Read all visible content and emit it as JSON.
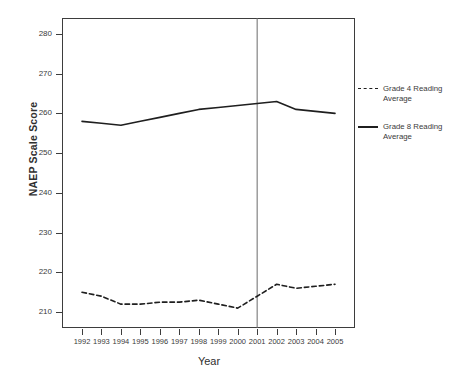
{
  "chart_data": {
    "type": "line",
    "title": "",
    "xlabel": "Year",
    "ylabel": "NAEP Scale Score",
    "categories": [
      1992,
      1993,
      1994,
      1995,
      1996,
      1997,
      1998,
      1999,
      2000,
      2001,
      2002,
      2003,
      2004,
      2005
    ],
    "x": [
      1992,
      1993,
      1994,
      1995,
      1996,
      1997,
      1998,
      1999,
      2000,
      2001,
      2002,
      2003,
      2004,
      2005
    ],
    "xlim": [
      1992,
      2005
    ],
    "ylim": [
      206,
      284
    ],
    "yticks": [
      210,
      220,
      230,
      240,
      250,
      260,
      270,
      280
    ],
    "xticks": [
      "1992",
      "1993",
      "1994",
      "1995",
      "1996",
      "1997",
      "1998",
      "1999",
      "2000",
      "2001",
      "2002",
      "2003",
      "2004",
      "2005"
    ],
    "grid": false,
    "legend_position": "right",
    "series": [
      {
        "name": "Grade 4 Reading Average",
        "style": "dashed",
        "color": "#1f1f1f",
        "values": [
          215,
          214,
          212,
          212,
          212.5,
          212.5,
          213,
          212,
          211,
          214,
          217,
          216,
          216.5,
          217
        ]
      },
      {
        "name": "Grade 8 Reading Average",
        "style": "solid",
        "color": "#1f1f1f",
        "values": [
          258,
          257.5,
          257,
          258,
          259,
          260,
          261,
          261.5,
          262,
          262.5,
          263,
          261,
          260.5,
          260
        ]
      }
    ],
    "annotations": [
      {
        "type": "vline",
        "x": 2001,
        "color": "#6b6b6b",
        "label": ""
      }
    ]
  },
  "legend": {
    "entries": [
      {
        "label": "Grade 4 Reading Average",
        "style": "dashed"
      },
      {
        "label": "Grade 8 Reading Average",
        "style": "solid"
      }
    ]
  },
  "axes": {
    "y_title": "NAEP Scale Score",
    "x_title": "Year",
    "y_tick_labels": [
      "280",
      "270",
      "260",
      "250",
      "240",
      "230",
      "220",
      "210"
    ],
    "x_tick_labels": [
      "1992",
      "1993",
      "1994",
      "1995",
      "1996",
      "1997",
      "1998",
      "1999",
      "2000",
      "2001",
      "2002",
      "2003",
      "2004",
      "2005"
    ]
  },
  "caption": {
    "text": ""
  }
}
